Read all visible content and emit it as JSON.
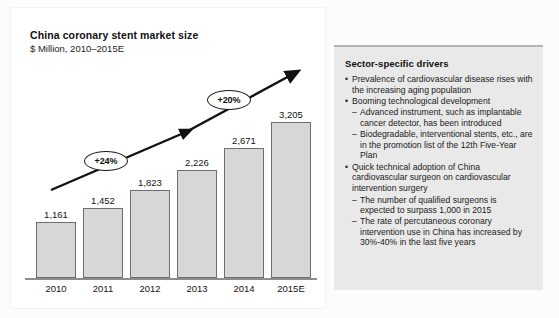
{
  "chart_data": {
    "type": "bar",
    "title": "China coronary stent market size",
    "subtitle": "$ Million, 2010–2015E",
    "xlabel": "",
    "ylabel": "$ Million",
    "categories": [
      "2010",
      "2011",
      "2012",
      "2013",
      "2014",
      "2015E"
    ],
    "values": [
      1161,
      1452,
      1823,
      2226,
      2671,
      3205
    ],
    "value_labels": [
      "1,161",
      "1,452",
      "1,823",
      "2,226",
      "2,671",
      "3,205"
    ],
    "ylim": [
      0,
      3400
    ],
    "grid": false,
    "legend": "none",
    "annotations": [
      {
        "label": "+24%",
        "meaning": "CAGR 2010–2013"
      },
      {
        "label": "+20%",
        "meaning": "CAGR 2013–2015E"
      }
    ],
    "trend_arrow": "rising arrow across bars",
    "bar_color": "#d7d7d7",
    "bar_border_color": "#6e6e6e"
  },
  "drivers": {
    "title": "Sector-specific drivers",
    "bullet_glyph": "•",
    "dash_glyph": "–",
    "items": [
      {
        "text": "Prevalence of cardiovascular disease rises with the increasing aging population",
        "sub": []
      },
      {
        "text": "Booming technological development",
        "sub": [
          "Advanced instrument, such as implantable cancer detector, has been introduced",
          "Biodegradable, interventional stents, etc., are in the promotion list of the 12th Five-Year Plan"
        ]
      },
      {
        "text": "Quick technical adoption of China cardiovascular surgeon on cardiovascular intervention surgery",
        "sub": [
          "The number of qualified surgeons is expected to surpass 1,000 in 2015",
          "The rate of percutaneous coronary intervention use in China has increased by 30%-40% in the last five years"
        ]
      }
    ]
  },
  "colors": {
    "panel_bg": "#e9e9e9",
    "bar_fill": "#d7d7d7",
    "axis": "#8c8c8c",
    "text": "#1a1a1a"
  }
}
